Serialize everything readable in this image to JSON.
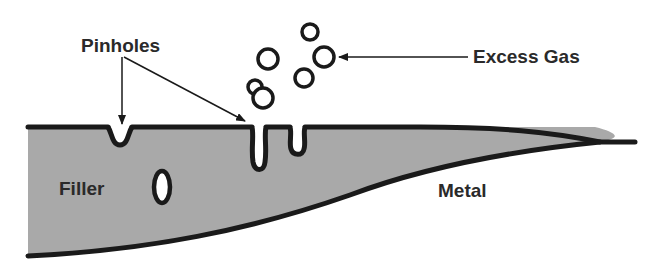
{
  "diagram": {
    "labels": {
      "pinholes": "Pinholes",
      "excess_gas": "Excess Gas",
      "filler": "Filler",
      "metal": "Metal"
    },
    "colors": {
      "filler_fill": "#a9a9a9",
      "outline": "#1a1a1a",
      "background": "#ffffff",
      "text": "#2a2a2a"
    }
  }
}
